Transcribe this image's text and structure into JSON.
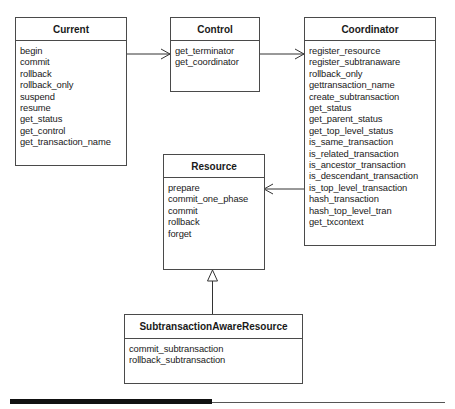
{
  "classes": {
    "current": {
      "name": "Current",
      "operations": [
        "begin",
        "commit",
        "rollback",
        "rollback_only",
        "suspend",
        "resume",
        "get_status",
        "get_control",
        "get_transaction_name"
      ]
    },
    "control": {
      "name": "Control",
      "operations": [
        "get_terminator",
        "get_coordinator"
      ]
    },
    "coordinator": {
      "name": "Coordinator",
      "operations": [
        "register_resource",
        "register_subtranaware",
        "rollback_only",
        "gettransaction_name",
        "create_subtransaction",
        "get_status",
        "get_parent_status",
        "get_top_level_status",
        "is_same_transaction",
        "is_related_transaction",
        "is_ancestor_transaction",
        "is_descendant_transaction",
        "is_top_level_transaction",
        "hash_transaction",
        "hash_top_level_tran",
        "get_txcontext"
      ]
    },
    "resource": {
      "name": "Resource",
      "operations": [
        "prepare",
        "commit_one_phase",
        "commit",
        "rollback",
        "forget"
      ]
    },
    "subtransaction_aware_resource": {
      "name": "SubtransactionAwareResource",
      "operations": [
        "commit_subtransaction",
        "rollback_subtransaction"
      ]
    }
  },
  "relationships": [
    {
      "from": "Current",
      "to": "Control",
      "type": "navigable-association"
    },
    {
      "from": "Control",
      "to": "Coordinator",
      "type": "navigable-association"
    },
    {
      "from": "Coordinator",
      "to": "Resource",
      "type": "navigable-association"
    },
    {
      "from": "SubtransactionAwareResource",
      "to": "Resource",
      "type": "generalization"
    }
  ]
}
